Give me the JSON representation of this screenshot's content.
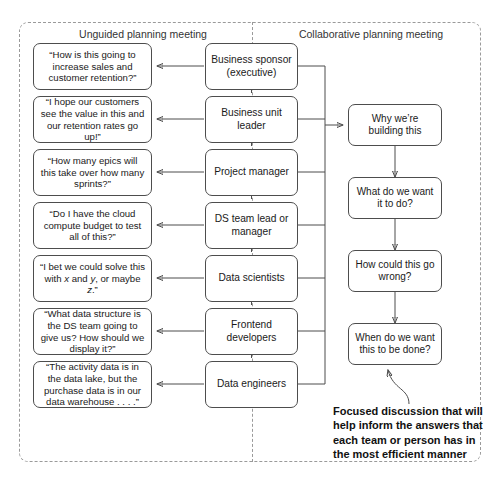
{
  "headers": {
    "left": "Unguided planning meeting",
    "right": "Collaborative planning meeting"
  },
  "roles": [
    {
      "label": "Business sponsor\n(executive)"
    },
    {
      "label": "Business unit leader"
    },
    {
      "label": "Project manager"
    },
    {
      "label": "DS team lead or\nmanager"
    },
    {
      "label": "Data scientists"
    },
    {
      "label": "Frontend\ndevelopers"
    },
    {
      "label": "Data engineers"
    }
  ],
  "quotes": [
    {
      "text": "“How is this going to increase sales and customer retention?”"
    },
    {
      "text": "“I hope our customers see the value in this and our retention rates go up!”"
    },
    {
      "text": "“How many epics will this take over how many sprints?”"
    },
    {
      "text": "“Do I have the cloud compute budget to test all of this?”"
    },
    {
      "text": "“I bet we could solve this with x and y, or maybe z.”"
    },
    {
      "text": "“What data structure is the DS team going to give us? How should we display it?”"
    },
    {
      "text": "“The activity data is in the data lake, but the purchase data is in our data warehouse . . . .”"
    }
  ],
  "collaborative_questions": [
    {
      "text": "Why we’re building this"
    },
    {
      "text": "What do we want it to do?"
    },
    {
      "text": "How could this go wrong?"
    },
    {
      "text": "When do we want this to be done?"
    }
  ],
  "caption": "Focused discussion that will help inform the answers that each team or person has in the most efficient manner",
  "colors": {
    "node_border": "#4d4d4d",
    "frame_dashed": "#9a9a9a",
    "text": "#1a1a1a",
    "background": "#ffffff"
  }
}
